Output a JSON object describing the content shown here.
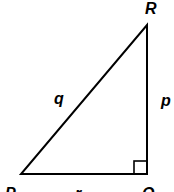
{
  "diagram": {
    "type": "right-triangle",
    "vertices": {
      "P": {
        "label": "P"
      },
      "Q": {
        "label": "Q"
      },
      "R": {
        "label": "R"
      }
    },
    "sides": {
      "q": {
        "label": "q",
        "between": "P-R"
      },
      "p": {
        "label": "p",
        "between": "Q-R"
      },
      "r": {
        "label": "r",
        "between": "P-Q"
      }
    },
    "right_angle_at": "Q",
    "stroke_color": "#000000",
    "background": "#ffffff"
  }
}
